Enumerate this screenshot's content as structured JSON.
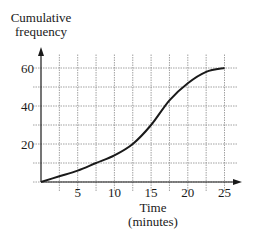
{
  "chart_data": {
    "type": "line",
    "title": "",
    "xlabel": "Time\n(minutes)",
    "xlabel_lines": [
      "Time",
      "(minutes)"
    ],
    "ylabel": "Cumulative frequency",
    "ylabel_lines": [
      "Cumulative",
      "frequency"
    ],
    "x": [
      0,
      2.5,
      5,
      7.5,
      10,
      12.5,
      15,
      17.5,
      20,
      22.5,
      25
    ],
    "series": [
      {
        "name": "Cumulative frequency",
        "values": [
          0,
          3,
          6,
          10,
          14,
          20,
          30,
          43,
          52,
          58,
          60
        ]
      }
    ],
    "xticks": [
      5,
      10,
      15,
      20,
      25
    ],
    "yticks": [
      20,
      40,
      60
    ],
    "xlim": [
      0,
      27
    ],
    "ylim": [
      0,
      65
    ],
    "grid": {
      "on": true,
      "x_step": 2.5,
      "y_step": 10,
      "style": "dotted"
    },
    "legend": null,
    "line_color": "#1a1a1a"
  }
}
